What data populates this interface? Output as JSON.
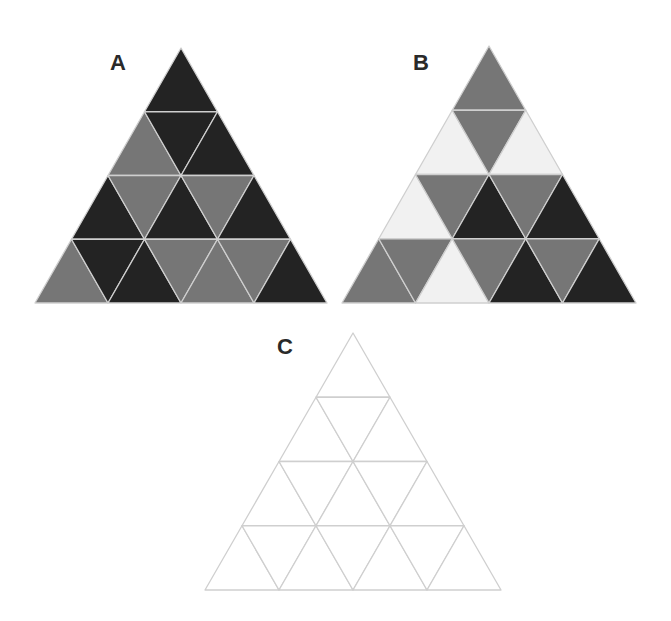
{
  "colors": {
    "D": "#232323",
    "G": "#767676",
    "L": "#f1f1f1",
    "W": "#ffffff",
    "line": "#cfcfcf"
  },
  "panels": [
    {
      "id": "A",
      "label": "A",
      "label_pos": [
        110,
        52
      ],
      "apex": [
        181,
        48
      ],
      "base_y": 303,
      "half_base": 146,
      "rows": [
        [
          "D"
        ],
        [
          "G",
          "D",
          "D"
        ],
        [
          "D",
          "G",
          "D",
          "G",
          "D"
        ],
        [
          "G",
          "D",
          "D",
          "G",
          "G",
          "G",
          "D"
        ]
      ]
    },
    {
      "id": "B",
      "label": "B",
      "label_pos": [
        413,
        52
      ],
      "apex": [
        489,
        46
      ],
      "base_y": 303,
      "half_base": 147,
      "rows": [
        [
          "G"
        ],
        [
          "L",
          "G",
          "L"
        ],
        [
          "L",
          "G",
          "D",
          "G",
          "D"
        ],
        [
          "G",
          "G",
          "L",
          "G",
          "D",
          "G",
          "D"
        ]
      ]
    },
    {
      "id": "C",
      "label": "C",
      "label_pos": [
        277,
        336
      ],
      "apex": [
        353,
        333
      ],
      "base_y": 590,
      "half_base": 148,
      "rows": [
        [
          "W"
        ],
        [
          "W",
          "W",
          "W"
        ],
        [
          "W",
          "W",
          "W",
          "W",
          "W"
        ],
        [
          "W",
          "W",
          "W",
          "W",
          "W",
          "W",
          "W"
        ]
      ]
    }
  ]
}
